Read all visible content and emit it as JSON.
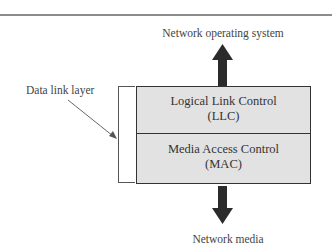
{
  "diagram": {
    "top_label": "Network operating system",
    "bottom_label": "Network media",
    "side_label": "Data link layer",
    "layers": [
      {
        "name": "Logical Link Control",
        "abbr": "(LLC)"
      },
      {
        "name": "Media Access Control",
        "abbr": "(MAC)"
      }
    ],
    "arrows": [
      {
        "direction": "up",
        "from": "stack",
        "to": "Network operating system"
      },
      {
        "direction": "down",
        "from": "stack",
        "to": "Network media"
      }
    ],
    "colors": {
      "layer_fill": "#e2e2e2",
      "border": "#333333",
      "arrow": "#2b2b2b",
      "rule": "#8c8c8c"
    }
  }
}
